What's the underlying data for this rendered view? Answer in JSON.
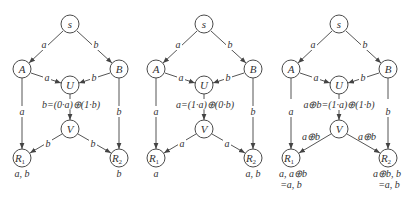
{
  "colors": {
    "line": "#555555",
    "node_stroke": "#4a4a4a",
    "text": "#333333",
    "background": "#ffffff"
  },
  "diagrams": [
    {
      "nodes": {
        "s": "s",
        "A": "A",
        "B": "B",
        "U": "U",
        "V": "V",
        "R1": "R",
        "R1_sub": "1",
        "R2": "R",
        "R2_sub": "2"
      },
      "edges": {
        "sA": "a",
        "sB": "b",
        "AU": "a",
        "BU": "b",
        "AR1": "a",
        "BR2": "b",
        "VR1": "b",
        "VR2": "b"
      },
      "coding_equation": "b=(0·a)⊕(1·b)",
      "sink_R1": [
        "a, b"
      ],
      "sink_R2": [
        "b"
      ]
    },
    {
      "nodes": {
        "s": "s",
        "A": "A",
        "B": "B",
        "U": "U",
        "V": "V",
        "R1": "R",
        "R1_sub": "1",
        "R2": "R",
        "R2_sub": "2"
      },
      "edges": {
        "sA": "a",
        "sB": "b",
        "AU": "a",
        "BU": "b",
        "AR1": "a",
        "BR2": "b",
        "VR1": "a",
        "VR2": "a"
      },
      "coding_equation": "a=(1·a)⊕(0·b)",
      "sink_R1": [
        "a"
      ],
      "sink_R2": [
        "a, b"
      ]
    },
    {
      "nodes": {
        "s": "s",
        "A": "A",
        "B": "B",
        "U": "U",
        "V": "V",
        "R1": "R",
        "R1_sub": "1",
        "R2": "R",
        "R2_sub": "2"
      },
      "edges": {
        "sA": "a",
        "sB": "b",
        "AU": "a",
        "BU": "b",
        "AR1": "a",
        "BR2": "b",
        "VR1": "a⊕b",
        "VR2": "a⊕b"
      },
      "coding_equation": "a⊕b=(1·a)⊕(1·b)",
      "sink_R1": [
        "a, a⊕b",
        "=a, b"
      ],
      "sink_R2": [
        "a⊕b, b",
        "=a, b"
      ]
    }
  ]
}
